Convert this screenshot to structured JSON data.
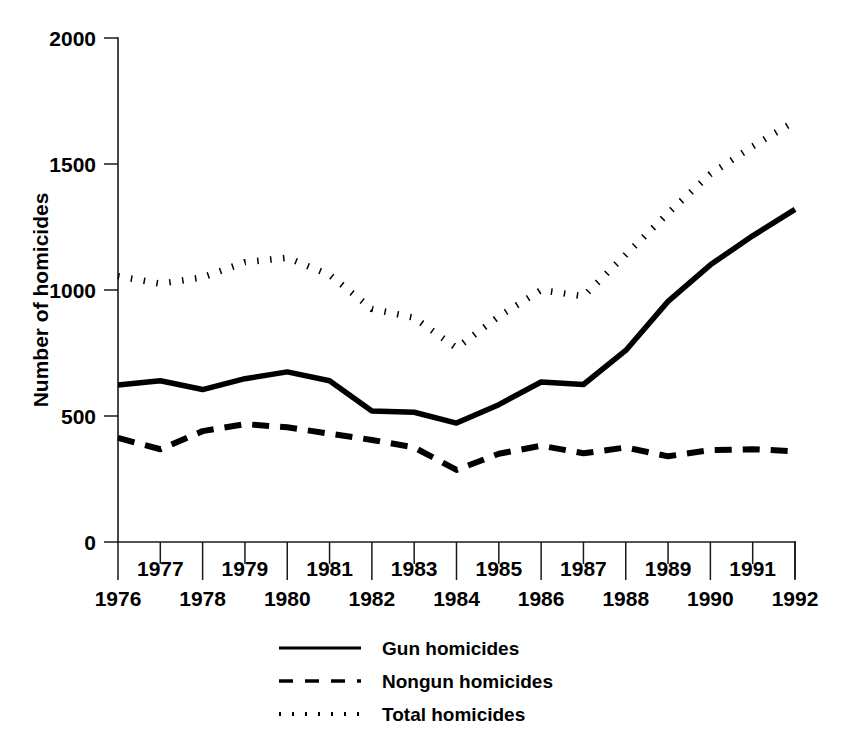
{
  "chart_data": {
    "type": "line",
    "title": "",
    "subtitle": "",
    "xlabel": "",
    "ylabel": "Number of homicides",
    "x": [
      1976,
      1977,
      1978,
      1979,
      1980,
      1981,
      1982,
      1983,
      1984,
      1985,
      1986,
      1987,
      1988,
      1989,
      1990,
      1991,
      1992
    ],
    "xtick_labels_upper": [
      "1977",
      "1979",
      "1981",
      "1983",
      "1985",
      "1987",
      "1989",
      "1991"
    ],
    "xtick_labels_lower": [
      "1976",
      "1978",
      "1980",
      "1982",
      "1984",
      "1986",
      "1988",
      "1990",
      "1992"
    ],
    "xlim": [
      1976,
      1992
    ],
    "ylim": [
      0,
      2000
    ],
    "ytick_labels": [
      "0",
      "500",
      "1000",
      "1500",
      "2000"
    ],
    "ytick_values": [
      0,
      500,
      1000,
      1500,
      2000
    ],
    "grid": false,
    "legend_position": "bottom-center",
    "series": [
      {
        "name": "Gun homicides",
        "style": "solid",
        "values": [
          623,
          640,
          605,
          648,
          675,
          640,
          520,
          515,
          472,
          545,
          635,
          625,
          760,
          955,
          1100,
          1215,
          1320
        ]
      },
      {
        "name": "Nongun homicides",
        "style": "dashed",
        "values": [
          413,
          368,
          440,
          468,
          455,
          430,
          405,
          375,
          286,
          350,
          382,
          352,
          375,
          340,
          365,
          368,
          360
        ]
      },
      {
        "name": "Total homicides",
        "style": "dotted",
        "values": [
          1055,
          1025,
          1050,
          1110,
          1128,
          1060,
          925,
          890,
          770,
          895,
          1000,
          975,
          1140,
          1305,
          1460,
          1570,
          1670
        ]
      }
    ]
  },
  "legend": {
    "entries": [
      {
        "label": "Gun homicides",
        "style": "solid"
      },
      {
        "label": "Nongun homicides",
        "style": "dashed"
      },
      {
        "label": "Total homicides",
        "style": "dotted"
      }
    ]
  },
  "colors": {
    "ink": "#000000",
    "axis": "#1a1a1a",
    "background": "#ffffff"
  }
}
